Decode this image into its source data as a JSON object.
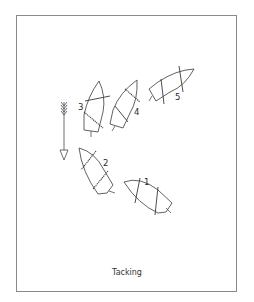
{
  "figure": {
    "caption": "Tacking",
    "wind_indicator": {
      "icon": "wind-arrow-icon",
      "direction": "down"
    },
    "boats": [
      {
        "label": "1",
        "position": 1,
        "state": "close-hauled"
      },
      {
        "label": "2",
        "position": 2,
        "state": "heading up"
      },
      {
        "label": "3",
        "position": 3,
        "state": "head to wind"
      },
      {
        "label": "4",
        "position": 4,
        "state": "bearing away"
      },
      {
        "label": "5",
        "position": 5,
        "state": "close-hauled new tack"
      }
    ]
  }
}
